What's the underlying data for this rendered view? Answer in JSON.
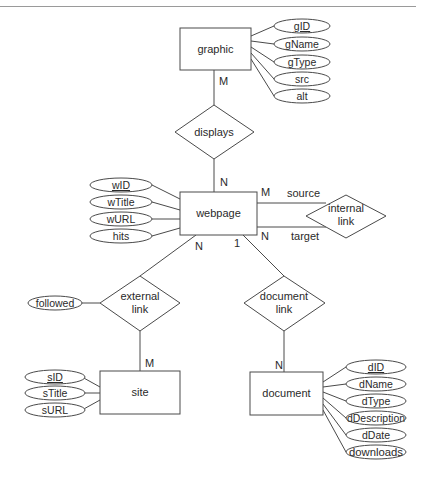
{
  "diagram": {
    "type": "ER diagram",
    "entities": [
      {
        "id": "graphic",
        "label": "graphic",
        "attributes": [
          {
            "label": "gID",
            "key": true
          },
          {
            "label": "gName",
            "key": false
          },
          {
            "label": "gType",
            "key": false
          },
          {
            "label": "src",
            "key": false
          },
          {
            "label": "alt",
            "key": false
          }
        ]
      },
      {
        "id": "webpage",
        "label": "webpage",
        "attributes": [
          {
            "label": "wID",
            "key": true
          },
          {
            "label": "wTitle",
            "key": false
          },
          {
            "label": "wURL",
            "key": false
          },
          {
            "label": "hits",
            "key": false
          }
        ]
      },
      {
        "id": "site",
        "label": "site",
        "attributes": [
          {
            "label": "sID",
            "key": true
          },
          {
            "label": "sTitle",
            "key": false
          },
          {
            "label": "sURL",
            "key": false
          }
        ]
      },
      {
        "id": "document",
        "label": "document",
        "attributes": [
          {
            "label": "dID",
            "key": true
          },
          {
            "label": "dName",
            "key": false
          },
          {
            "label": "dType",
            "key": false
          },
          {
            "label": "dDescription",
            "key": false
          },
          {
            "label": "dDate",
            "key": false
          },
          {
            "label": "downloads",
            "key": false
          }
        ]
      }
    ],
    "relationships": [
      {
        "id": "displays",
        "lines": [
          "displays"
        ],
        "attributes": []
      },
      {
        "id": "internal-link",
        "lines": [
          "internal",
          "link"
        ],
        "attributes": []
      },
      {
        "id": "external-link",
        "lines": [
          "external",
          "link"
        ],
        "attributes": [
          {
            "label": "followed",
            "key": false
          }
        ]
      },
      {
        "id": "document-link",
        "lines": [
          "document",
          "link"
        ],
        "attributes": []
      }
    ],
    "cardinalities": {
      "graphic_displays": "M",
      "displays_webpage": "N",
      "internal_source": "M",
      "internal_target": "N",
      "webpage_external": "N",
      "external_site": "M",
      "webpage_document": "1",
      "doclink_document": "N"
    },
    "role_labels": {
      "source": "source",
      "target": "target"
    }
  }
}
